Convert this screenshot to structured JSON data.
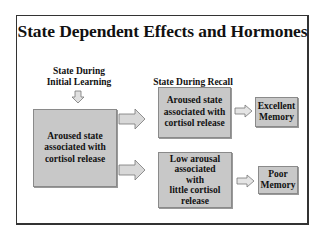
{
  "slide": {
    "title": "State Dependent Effects and Hormones",
    "learning_label_line1": "State During",
    "learning_label_line2": "Initial Learning",
    "recall_label": "State During Recall",
    "learning_box": {
      "line1": "Aroused state",
      "line2": "associated with",
      "line3": "cortisol release"
    },
    "recall_top_box": {
      "line1": "Aroused state",
      "line2": "associated with",
      "line3": "cortisol release"
    },
    "recall_bottom_box": {
      "line1": "Low arousal",
      "line2": "associated",
      "line3": "with",
      "line4": "little cortisol",
      "line5": "release"
    },
    "outcome_top": {
      "line1": "Excellent",
      "line2": "Memory"
    },
    "outcome_bottom": {
      "line1": "Poor",
      "line2": "Memory"
    },
    "colors": {
      "box_fill": "#c8c8c8",
      "border": "#333333"
    }
  }
}
